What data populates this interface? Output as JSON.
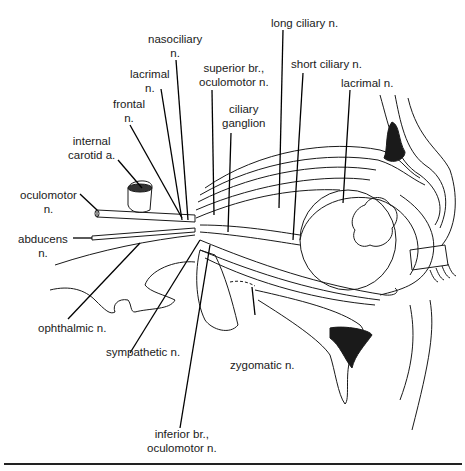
{
  "figure": {
    "labels": {
      "nasociliary": "nasociliary\nn.",
      "lacrimal_left": "lacrimal\nn.",
      "frontal": "frontal\nn.",
      "internal_carotid": "internal\ncarotid a.",
      "oculomotor": "oculomotor\nn.",
      "abducens": "abducens\nn.",
      "ophthalmic": "ophthalmic n.",
      "sympathetic": "sympathetic n.",
      "inferior_br": "inferior br.,\noculomotor n.",
      "superior_br": "superior br.,\noculomotor n.",
      "ciliary_ganglion": "ciliary\nganglion",
      "long_ciliary": "long ciliary n.",
      "short_ciliary": "short ciliary n.",
      "lacrimal_right": "lacrimal n.",
      "zygomatic": "zygomatic n."
    }
  }
}
